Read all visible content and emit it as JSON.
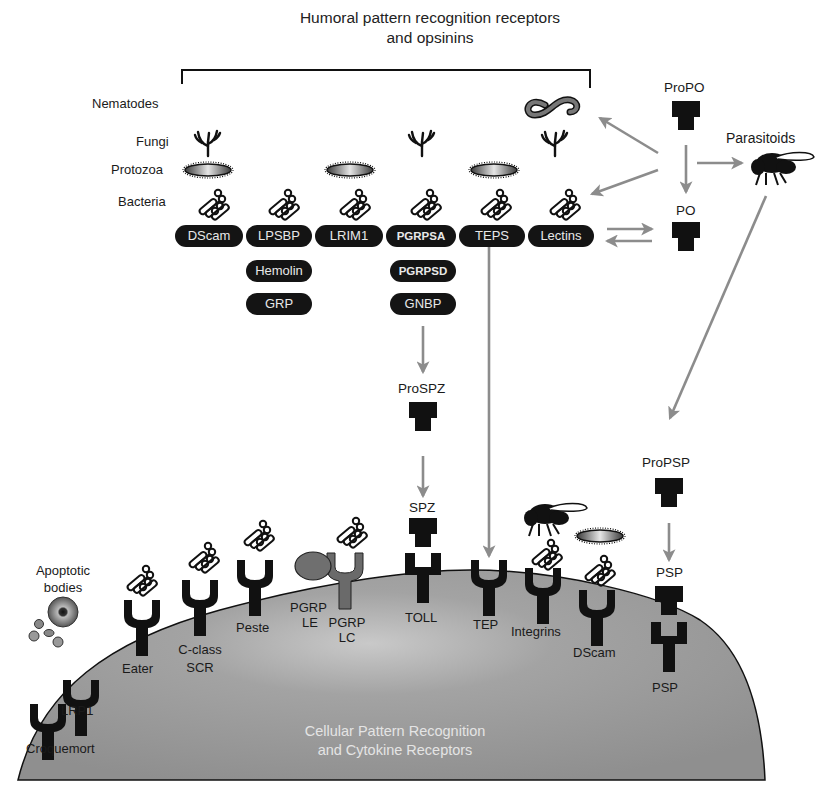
{
  "title": {
    "line1": "Humoral pattern recognition receptors",
    "line2": "and opsinins"
  },
  "pathogens": {
    "nematodes": "Nematodes",
    "fungi": "Fungi",
    "protozoa": "Protozoa",
    "bacteria": "Bacteria",
    "parasitoids": "Parasitoids",
    "apoptotic_bodies_line1": "Apoptotic",
    "apoptotic_bodies_line2": "bodies"
  },
  "humoral_receptors": {
    "row1": [
      "DScam",
      "LPSBP",
      "LRIM1",
      "PGRPSA",
      "TEPS",
      "Lectins"
    ],
    "row2": [
      "Hemolin",
      "PGRPSD"
    ],
    "row3": [
      "GRP",
      "GNBP"
    ]
  },
  "cascade": {
    "propo": "ProPO",
    "po": "PO",
    "prospz": "ProSPZ",
    "spz": "SPZ",
    "propsp": "ProPSP",
    "psp_ligand": "PSP"
  },
  "cellular_receptors": {
    "croquemort": "Croquemort",
    "lrp1": "LRP1",
    "eater": "Eater",
    "cclass_line1": "C-class",
    "cclass_line2": "SCR",
    "peste": "Peste",
    "pgrp_le_line1": "PGRP",
    "pgrp_le_line2": "LE",
    "pgrp_lc_line1": "PGRP",
    "pgrp_lc_line2": "LC",
    "toll": "TOLL",
    "tep": "TEP",
    "integrins": "Integrins",
    "dscam": "DScam",
    "psp_receptor": "PSP"
  },
  "cell": {
    "line1": "Cellular Pattern Recognition",
    "line2": "and Cytokine Receptors"
  },
  "colors": {
    "pill_bg": "#141414",
    "pill_text": "#e8e8e8",
    "arrow_gray": "#8c8c8c",
    "cell_gray": "#9a9a9a",
    "receptor_black": "#111111"
  }
}
